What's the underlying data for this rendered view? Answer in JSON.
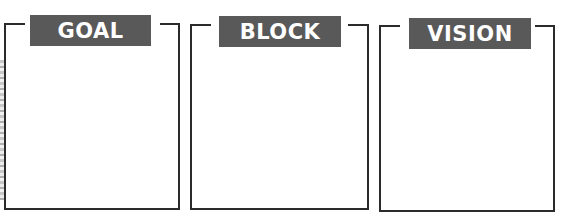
{
  "panels": [
    {
      "label": "GOAL",
      "content": ""
    },
    {
      "label": "BLOCK",
      "content": ""
    },
    {
      "label": "VISION",
      "content": ""
    }
  ],
  "colors": {
    "label_bg": "#595959",
    "label_text": "#ffffff",
    "border": "#2b2b2b",
    "background": "#ffffff"
  }
}
